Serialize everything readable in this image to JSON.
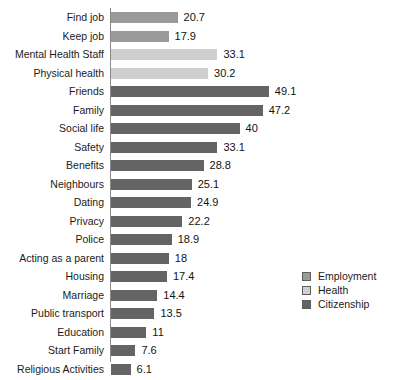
{
  "chart_data": {
    "type": "bar",
    "orientation": "horizontal",
    "title": "",
    "xlabel": "",
    "ylabel": "",
    "xlim": [
      0,
      52
    ],
    "grid": false,
    "legend_position": "right",
    "categories": [
      "Find job",
      "Keep job",
      "Mental Health Staff",
      "Physical health",
      "Friends",
      "Family",
      "Social life",
      "Safety",
      "Benefits",
      "Neighbours",
      "Dating",
      "Privacy",
      "Police",
      "Acting as a parent",
      "Housing",
      "Marriage",
      "Public transport",
      "Education",
      "Start Family",
      "Religious Activities"
    ],
    "values": [
      20.7,
      17.9,
      33.1,
      30.2,
      49.1,
      47.2,
      40,
      33.1,
      28.8,
      25.1,
      24.9,
      22.2,
      18.9,
      18,
      17.4,
      14.4,
      13.5,
      11,
      7.6,
      6.1
    ],
    "value_labels": [
      "20.7",
      "17.9",
      "33.1",
      "30.2",
      "49.1",
      "47.2",
      "40",
      "33.1",
      "28.8",
      "25.1",
      "24.9",
      "22.2",
      "18.9",
      "18",
      "17.4",
      "14.4",
      "13.5",
      "11",
      "7.6",
      "6.1"
    ],
    "groups": [
      "Employment",
      "Employment",
      "Health",
      "Health",
      "Citizenship",
      "Citizenship",
      "Citizenship",
      "Citizenship",
      "Citizenship",
      "Citizenship",
      "Citizenship",
      "Citizenship",
      "Citizenship",
      "Citizenship",
      "Citizenship",
      "Citizenship",
      "Citizenship",
      "Citizenship",
      "Citizenship",
      "Citizenship"
    ],
    "series": [
      {
        "name": "Employment",
        "color": "#9a9a9a"
      },
      {
        "name": "Health",
        "color": "#cfcfcf"
      },
      {
        "name": "Citizenship",
        "color": "#646464"
      }
    ]
  },
  "legend": {
    "items": [
      {
        "label": "Employment",
        "color": "#9a9a9a"
      },
      {
        "label": "Health",
        "color": "#cfcfcf"
      },
      {
        "label": "Citizenship",
        "color": "#646464"
      }
    ]
  }
}
